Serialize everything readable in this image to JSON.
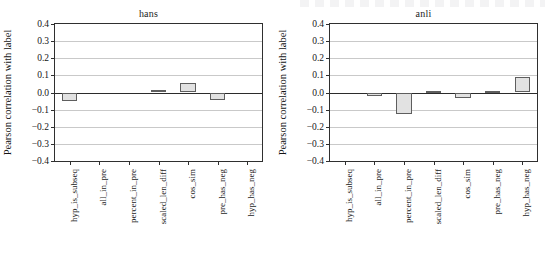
{
  "figure": {
    "width": 550,
    "height": 270,
    "background": "#ffffff",
    "bar_fill": "#e2e2e2",
    "bar_edge": "#5e5e5e",
    "grid_color": "#c9c9c9",
    "axis_color": "#2f2f2f"
  },
  "chart_data": [
    {
      "type": "bar",
      "title": "hans",
      "xlabel": "",
      "ylabel": "Pearson correlation with label",
      "ylim": [
        -0.4,
        0.4
      ],
      "yticks": [
        0.4,
        0.3,
        0.2,
        0.1,
        0.0,
        -0.1,
        -0.2,
        -0.3,
        -0.4
      ],
      "ytick_labels": [
        "0.4",
        "0.3",
        "0.2",
        "0.1",
        "0.0",
        "−0.1",
        "−0.2",
        "−0.3",
        "−0.4"
      ],
      "grid": true,
      "legend": "none",
      "categories": [
        "hyp_is_subseq",
        "all_in_pre",
        "percent_in_pre",
        "scaled_len_diff",
        "cos_sim",
        "pre_has_neg",
        "hyp_has_neg"
      ],
      "values": [
        -0.048,
        0.0,
        0.0,
        0.012,
        0.055,
        -0.045,
        0.0
      ]
    },
    {
      "type": "bar",
      "title": "anli",
      "xlabel": "",
      "ylabel": "Pearson correlation with label",
      "ylim": [
        -0.4,
        0.4
      ],
      "yticks": [
        0.4,
        0.3,
        0.2,
        0.1,
        0.0,
        -0.1,
        -0.2,
        -0.3,
        -0.4
      ],
      "ytick_labels": [
        "0.4",
        "0.3",
        "0.2",
        "0.1",
        "0.0",
        "−0.1",
        "−0.2",
        "−0.3",
        "−0.4"
      ],
      "grid": true,
      "legend": "none",
      "categories": [
        "hyp_is_subseq",
        "all_in_pre",
        "percent_in_pre",
        "scaled_len_diff",
        "cos_sim",
        "pre_has_neg",
        "hyp_has_neg"
      ],
      "values": [
        0.0,
        -0.018,
        -0.128,
        0.008,
        -0.032,
        0.006,
        0.093
      ]
    }
  ]
}
